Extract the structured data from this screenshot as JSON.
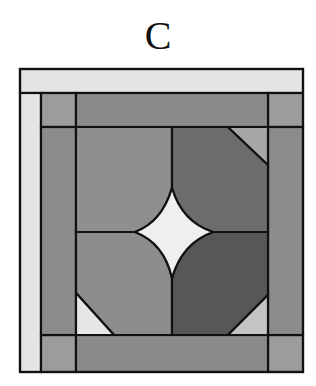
{
  "figure": {
    "label": "C"
  },
  "colors": {
    "outline": "#111111",
    "light_strip": "#e4e4e4",
    "corner_square": "#9c9c9c",
    "band": "#8a8a8a",
    "quadrant_top_left": "#8f8f8f",
    "quadrant_top_right": "#6c6c6c",
    "quadrant_bottom_left": "#8d8d8d",
    "quadrant_bottom_right": "#575757",
    "triangle_top_right": "#a6a6a6",
    "triangle_bottom_left": "#e6e6e6",
    "triangle_bottom_right": "#c4c4c4",
    "star": "#efefef"
  }
}
